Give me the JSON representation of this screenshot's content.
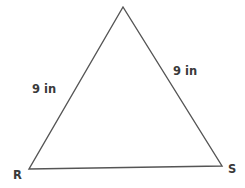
{
  "diagram": {
    "shape": "triangle",
    "vertices": [
      {
        "label": "",
        "x": 123,
        "y": 7
      },
      {
        "label": "R",
        "x": 29,
        "y": 169
      },
      {
        "label": "S",
        "x": 222,
        "y": 166
      }
    ],
    "side_labels": {
      "left": "9 in",
      "right": "9 in"
    },
    "stroke_color": "#555555"
  }
}
